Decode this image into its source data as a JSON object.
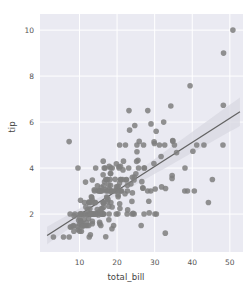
{
  "chart_data": {
    "type": "scatter",
    "title": "",
    "xlabel": "total_bill",
    "ylabel": "tip",
    "xlim": [
      -0.5,
      53.5
    ],
    "ylim": [
      0.35,
      10.7
    ],
    "xticks": [
      10,
      20,
      30,
      40,
      50
    ],
    "yticks": [
      2,
      4,
      6,
      8,
      10
    ],
    "xticklabels": [
      "10",
      "20",
      "30",
      "40",
      "50"
    ],
    "yticklabels": [
      "2",
      "4",
      "6",
      "8",
      "10"
    ],
    "grid": true,
    "legend": null,
    "style": "seaborn-darkgrid",
    "colors": {
      "panel_background": "#eaeaf2",
      "figure_background": "#ffffff",
      "gridline": "#ffffff",
      "point": "#7f7f7f",
      "regression_line": "#636363",
      "confidence_band": "#d8d8e2",
      "tick_text": "#555555",
      "axis_label_text": "#444444"
    },
    "marker": {
      "shape": "circle",
      "size": 4.4,
      "alpha": 0.85
    },
    "regression": {
      "shown": true,
      "slope": 0.105,
      "intercept": 0.92,
      "ci": 95,
      "band_halfwidth_at_xmin": 0.17,
      "band_halfwidth_at_xmax": 0.62
    },
    "series": [
      {
        "name": "tips",
        "points": [
          [
            16.99,
            1.01
          ],
          [
            10.34,
            1.66
          ],
          [
            21.01,
            3.5
          ],
          [
            23.68,
            3.31
          ],
          [
            24.59,
            3.61
          ],
          [
            25.29,
            4.71
          ],
          [
            8.77,
            2.0
          ],
          [
            26.88,
            3.12
          ],
          [
            15.04,
            1.96
          ],
          [
            14.78,
            3.23
          ],
          [
            10.27,
            1.71
          ],
          [
            35.26,
            5.0
          ],
          [
            15.42,
            1.57
          ],
          [
            18.43,
            3.0
          ],
          [
            14.83,
            3.02
          ],
          [
            21.58,
            3.92
          ],
          [
            10.33,
            1.67
          ],
          [
            16.29,
            3.71
          ],
          [
            16.97,
            3.5
          ],
          [
            20.65,
            3.35
          ],
          [
            17.92,
            4.08
          ],
          [
            20.29,
            2.75
          ],
          [
            15.77,
            2.23
          ],
          [
            39.42,
            7.58
          ],
          [
            19.82,
            3.18
          ],
          [
            17.81,
            2.34
          ],
          [
            13.37,
            2.0
          ],
          [
            12.69,
            2.0
          ],
          [
            21.7,
            4.3
          ],
          [
            19.65,
            3.0
          ],
          [
            9.55,
            1.45
          ],
          [
            18.35,
            2.5
          ],
          [
            15.06,
            3.0
          ],
          [
            20.69,
            2.45
          ],
          [
            17.78,
            3.27
          ],
          [
            24.06,
            3.6
          ],
          [
            16.31,
            2.0
          ],
          [
            16.93,
            3.07
          ],
          [
            18.69,
            2.31
          ],
          [
            31.27,
            5.0
          ],
          [
            16.04,
            2.24
          ],
          [
            17.46,
            2.54
          ],
          [
            13.94,
            3.06
          ],
          [
            9.68,
            1.32
          ],
          [
            30.4,
            5.6
          ],
          [
            18.29,
            3.0
          ],
          [
            22.23,
            5.0
          ],
          [
            32.4,
            6.0
          ],
          [
            28.55,
            2.05
          ],
          [
            18.04,
            3.0
          ],
          [
            12.54,
            2.5
          ],
          [
            10.29,
            2.6
          ],
          [
            34.81,
            5.2
          ],
          [
            9.94,
            1.56
          ],
          [
            25.56,
            4.34
          ],
          [
            19.49,
            3.51
          ],
          [
            38.01,
            3.0
          ],
          [
            26.41,
            1.5
          ],
          [
            11.24,
            1.76
          ],
          [
            48.27,
            6.73
          ],
          [
            20.29,
            3.21
          ],
          [
            13.81,
            2.0
          ],
          [
            11.02,
            1.98
          ],
          [
            18.29,
            3.76
          ],
          [
            17.59,
            2.64
          ],
          [
            20.08,
            3.15
          ],
          [
            16.45,
            2.47
          ],
          [
            3.07,
            1.0
          ],
          [
            20.23,
            2.01
          ],
          [
            15.01,
            2.09
          ],
          [
            12.02,
            1.97
          ],
          [
            17.07,
            3.0
          ],
          [
            26.86,
            3.14
          ],
          [
            25.28,
            5.0
          ],
          [
            14.73,
            2.2
          ],
          [
            10.51,
            1.25
          ],
          [
            17.92,
            3.08
          ],
          [
            27.2,
            4.0
          ],
          [
            22.76,
            3.0
          ],
          [
            17.29,
            2.71
          ],
          [
            19.44,
            3.0
          ],
          [
            16.66,
            3.4
          ],
          [
            10.07,
            1.83
          ],
          [
            32.68,
            5.0
          ],
          [
            15.98,
            2.03
          ],
          [
            34.83,
            5.17
          ],
          [
            13.03,
            2.0
          ],
          [
            18.28,
            4.0
          ],
          [
            24.71,
            5.85
          ],
          [
            21.16,
            3.0
          ],
          [
            28.97,
            3.0
          ],
          [
            22.49,
            3.5
          ],
          [
            5.75,
            1.0
          ],
          [
            16.32,
            4.3
          ],
          [
            22.75,
            3.25
          ],
          [
            40.17,
            4.73
          ],
          [
            27.28,
            4.0
          ],
          [
            12.03,
            1.5
          ],
          [
            21.01,
            3.0
          ],
          [
            12.46,
            1.5
          ],
          [
            11.35,
            2.5
          ],
          [
            15.38,
            3.0
          ],
          [
            44.3,
            2.5
          ],
          [
            22.42,
            3.48
          ],
          [
            20.92,
            4.08
          ],
          [
            15.36,
            1.64
          ],
          [
            20.49,
            4.06
          ],
          [
            25.21,
            4.29
          ],
          [
            18.24,
            3.76
          ],
          [
            14.31,
            4.0
          ],
          [
            14.0,
            3.0
          ],
          [
            7.25,
            1.0
          ],
          [
            38.07,
            4.0
          ],
          [
            23.95,
            2.55
          ],
          [
            25.71,
            4.0
          ],
          [
            17.31,
            3.5
          ],
          [
            29.93,
            5.07
          ],
          [
            10.65,
            1.5
          ],
          [
            12.43,
            1.8
          ],
          [
            24.08,
            2.92
          ],
          [
            11.69,
            2.31
          ],
          [
            13.42,
            1.68
          ],
          [
            14.26,
            2.5
          ],
          [
            15.95,
            2.0
          ],
          [
            12.48,
            2.52
          ],
          [
            29.8,
            4.2
          ],
          [
            8.52,
            1.48
          ],
          [
            14.52,
            2.0
          ],
          [
            11.38,
            2.0
          ],
          [
            22.82,
            2.18
          ],
          [
            19.08,
            1.5
          ],
          [
            20.27,
            2.83
          ],
          [
            11.17,
            1.5
          ],
          [
            12.26,
            2.0
          ],
          [
            18.26,
            3.25
          ],
          [
            8.51,
            1.25
          ],
          [
            10.33,
            2.0
          ],
          [
            14.15,
            2.0
          ],
          [
            16.0,
            2.0
          ],
          [
            13.16,
            2.75
          ],
          [
            17.47,
            3.5
          ],
          [
            34.3,
            6.7
          ],
          [
            41.19,
            5.0
          ],
          [
            27.05,
            5.0
          ],
          [
            16.43,
            2.3
          ],
          [
            8.35,
            1.5
          ],
          [
            18.64,
            1.36
          ],
          [
            11.87,
            1.63
          ],
          [
            9.78,
            1.73
          ],
          [
            7.51,
            2.0
          ],
          [
            14.07,
            2.5
          ],
          [
            13.13,
            2.0
          ],
          [
            17.26,
            2.74
          ],
          [
            24.55,
            2.0
          ],
          [
            19.77,
            2.0
          ],
          [
            29.85,
            5.14
          ],
          [
            48.17,
            5.0
          ],
          [
            25.0,
            3.75
          ],
          [
            13.39,
            2.61
          ],
          [
            16.49,
            2.0
          ],
          [
            21.5,
            3.5
          ],
          [
            12.66,
            2.5
          ],
          [
            16.21,
            2.0
          ],
          [
            13.81,
            2.0
          ],
          [
            17.51,
            3.0
          ],
          [
            24.52,
            3.48
          ],
          [
            20.76,
            2.24
          ],
          [
            31.71,
            4.5
          ],
          [
            10.59,
            1.61
          ],
          [
            10.63,
            2.0
          ],
          [
            50.81,
            10.0
          ],
          [
            15.81,
            3.16
          ],
          [
            7.25,
            5.15
          ],
          [
            31.85,
            3.18
          ],
          [
            16.82,
            4.0
          ],
          [
            32.9,
            3.11
          ],
          [
            17.89,
            2.0
          ],
          [
            14.48,
            2.0
          ],
          [
            9.6,
            4.0
          ],
          [
            34.63,
            3.55
          ],
          [
            34.65,
            3.68
          ],
          [
            23.33,
            5.65
          ],
          [
            45.35,
            3.5
          ],
          [
            23.17,
            6.5
          ],
          [
            40.55,
            3.0
          ],
          [
            20.69,
            5.0
          ],
          [
            20.9,
            3.5
          ],
          [
            30.46,
            2.0
          ],
          [
            18.15,
            3.5
          ],
          [
            23.1,
            4.0
          ],
          [
            15.69,
            1.5
          ],
          [
            19.81,
            4.19
          ],
          [
            28.44,
            2.56
          ],
          [
            15.48,
            2.02
          ],
          [
            16.58,
            4.0
          ],
          [
            7.56,
            1.44
          ],
          [
            10.34,
            2.0
          ],
          [
            43.11,
            5.0
          ],
          [
            13.0,
            2.0
          ],
          [
            13.51,
            2.0
          ],
          [
            18.71,
            4.0
          ],
          [
            12.74,
            2.01
          ],
          [
            13.0,
            2.0
          ],
          [
            16.4,
            2.5
          ],
          [
            20.53,
            4.0
          ],
          [
            16.47,
            3.23
          ],
          [
            26.59,
            3.41
          ],
          [
            38.73,
            3.0
          ],
          [
            24.27,
            2.03
          ],
          [
            12.76,
            2.23
          ],
          [
            30.06,
            2.0
          ],
          [
            25.89,
            5.16
          ],
          [
            48.33,
            9.0
          ],
          [
            13.27,
            2.5
          ],
          [
            28.17,
            6.5
          ],
          [
            12.9,
            1.1
          ],
          [
            28.15,
            3.0
          ],
          [
            11.59,
            1.5
          ],
          [
            7.74,
            1.44
          ],
          [
            30.14,
            3.09
          ],
          [
            12.16,
            2.2
          ],
          [
            13.42,
            3.48
          ],
          [
            8.58,
            1.92
          ],
          [
            15.98,
            3.0
          ],
          [
            13.42,
            1.58
          ],
          [
            16.27,
            2.5
          ],
          [
            10.09,
            2.0
          ],
          [
            20.45,
            3.0
          ],
          [
            13.28,
            2.72
          ],
          [
            22.12,
            2.88
          ],
          [
            24.01,
            2.0
          ],
          [
            15.69,
            3.0
          ],
          [
            11.61,
            3.39
          ],
          [
            10.77,
            1.47
          ],
          [
            15.53,
            3.0
          ],
          [
            10.07,
            1.25
          ],
          [
            12.6,
            1.0
          ],
          [
            32.83,
            1.17
          ],
          [
            35.83,
            4.67
          ],
          [
            29.03,
            5.92
          ],
          [
            27.18,
            2.0
          ],
          [
            22.67,
            2.0
          ],
          [
            17.82,
            1.75
          ],
          [
            18.78,
            3.0
          ]
        ]
      }
    ]
  }
}
